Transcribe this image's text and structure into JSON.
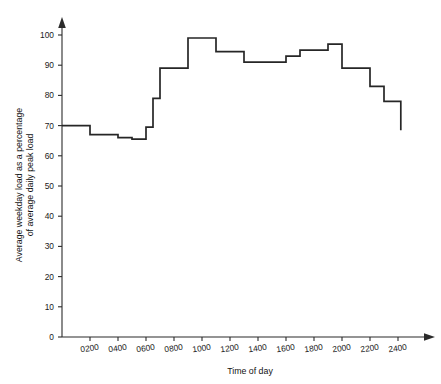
{
  "chart_data": {
    "type": "line",
    "subtype": "step",
    "title": "",
    "xlabel": "Time of day",
    "ylabel": "Average weekday load as a percentage of average daily peak load",
    "ylabel_line1": "Average weekday load as a percentage",
    "ylabel_line2": "of average daily peak load",
    "xlim": [
      0,
      2450
    ],
    "ylim": [
      0,
      105
    ],
    "grid": false,
    "legend": false,
    "legend_position": "none",
    "y_ticks": [
      0,
      10,
      20,
      30,
      40,
      50,
      60,
      70,
      80,
      90,
      100
    ],
    "y_tick_labels": [
      "0",
      "10",
      "20",
      "30",
      "40",
      "50",
      "60",
      "70",
      "80",
      "90",
      "100"
    ],
    "x_ticks": [
      200,
      400,
      600,
      800,
      1000,
      1200,
      1400,
      1600,
      1800,
      2000,
      2200,
      2400
    ],
    "x_tick_labels": [
      "0200",
      "0400",
      "0600",
      "0800",
      "1000",
      "1200",
      "1400",
      "1600",
      "1800",
      "2000",
      "2200",
      "2400"
    ],
    "x_start": 0,
    "x_axis_end": 2450,
    "steps": [
      {
        "x_start": 0,
        "x_end": 200,
        "value": 70
      },
      {
        "x_start": 200,
        "x_end": 400,
        "value": 67
      },
      {
        "x_start": 400,
        "x_end": 500,
        "value": 66
      },
      {
        "x_start": 500,
        "x_end": 600,
        "value": 65.5
      },
      {
        "x_start": 600,
        "x_end": 650,
        "value": 69.5
      },
      {
        "x_start": 650,
        "x_end": 700,
        "value": 79
      },
      {
        "x_start": 700,
        "x_end": 900,
        "value": 89
      },
      {
        "x_start": 900,
        "x_end": 1100,
        "value": 99
      },
      {
        "x_start": 1100,
        "x_end": 1300,
        "value": 94.5
      },
      {
        "x_start": 1300,
        "x_end": 1600,
        "value": 91
      },
      {
        "x_start": 1600,
        "x_end": 1700,
        "value": 93
      },
      {
        "x_start": 1700,
        "x_end": 1900,
        "value": 95
      },
      {
        "x_start": 1900,
        "x_end": 2000,
        "value": 97
      },
      {
        "x_start": 2000,
        "x_end": 2200,
        "value": 89
      },
      {
        "x_start": 2200,
        "x_end": 2300,
        "value": 83
      },
      {
        "x_start": 2300,
        "x_end": 2420,
        "value": 78
      }
    ],
    "end_drop_value": 68.5,
    "series": [
      {
        "name": "Average weekday load",
        "x": [
          0,
          200,
          400,
          500,
          600,
          650,
          700,
          900,
          1100,
          1300,
          1600,
          1700,
          1900,
          2000,
          2200,
          2300,
          2420
        ],
        "values": [
          70,
          67,
          66,
          65.5,
          69.5,
          79,
          89,
          99,
          94.5,
          91,
          93,
          95,
          97,
          89,
          83,
          78,
          68.5
        ]
      }
    ],
    "colors": {
      "line": "#262626",
      "axis": "#2b2b2b",
      "text": "#1a1a1a",
      "background": "#ffffff"
    }
  }
}
